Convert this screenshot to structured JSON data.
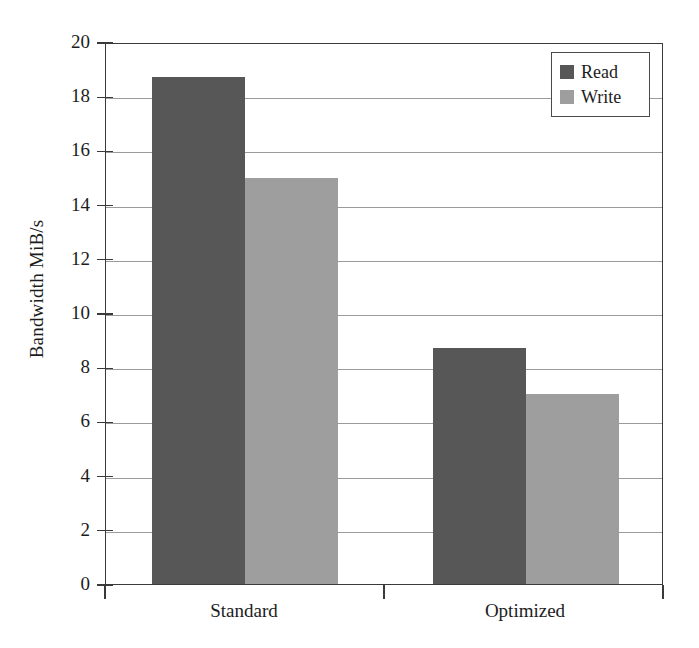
{
  "chart_data": {
    "type": "bar",
    "title": "",
    "xlabel": "",
    "ylabel": "Bandwidth MiB/s",
    "categories": [
      "Standard",
      "Optimized"
    ],
    "series": [
      {
        "name": "Read",
        "color": "#575757",
        "values": [
          18.7,
          8.7
        ]
      },
      {
        "name": "Write",
        "color": "#9e9e9e",
        "values": [
          15.0,
          7.0
        ]
      }
    ],
    "ylim": [
      0,
      20
    ],
    "ytick_step": 2,
    "ytick_labels": [
      "20",
      "18",
      "16",
      "14",
      "12",
      "10",
      "8",
      "6",
      "4",
      "2",
      "0"
    ],
    "ytick_values": [
      20,
      18,
      16,
      14,
      12,
      10,
      8,
      6,
      4,
      2,
      0
    ],
    "grid": true,
    "grid_axis": "y",
    "legend_position": "top-right",
    "legend_entries": [
      "Read",
      "Write"
    ],
    "bar_grouping": "grouped",
    "frame": true
  },
  "colors": {
    "read": "#575757",
    "write": "#9e9e9e",
    "grid": "#9b9b9b",
    "axis": "#3a3a3a",
    "background": "#ffffff",
    "text": "#1c1c1c"
  }
}
